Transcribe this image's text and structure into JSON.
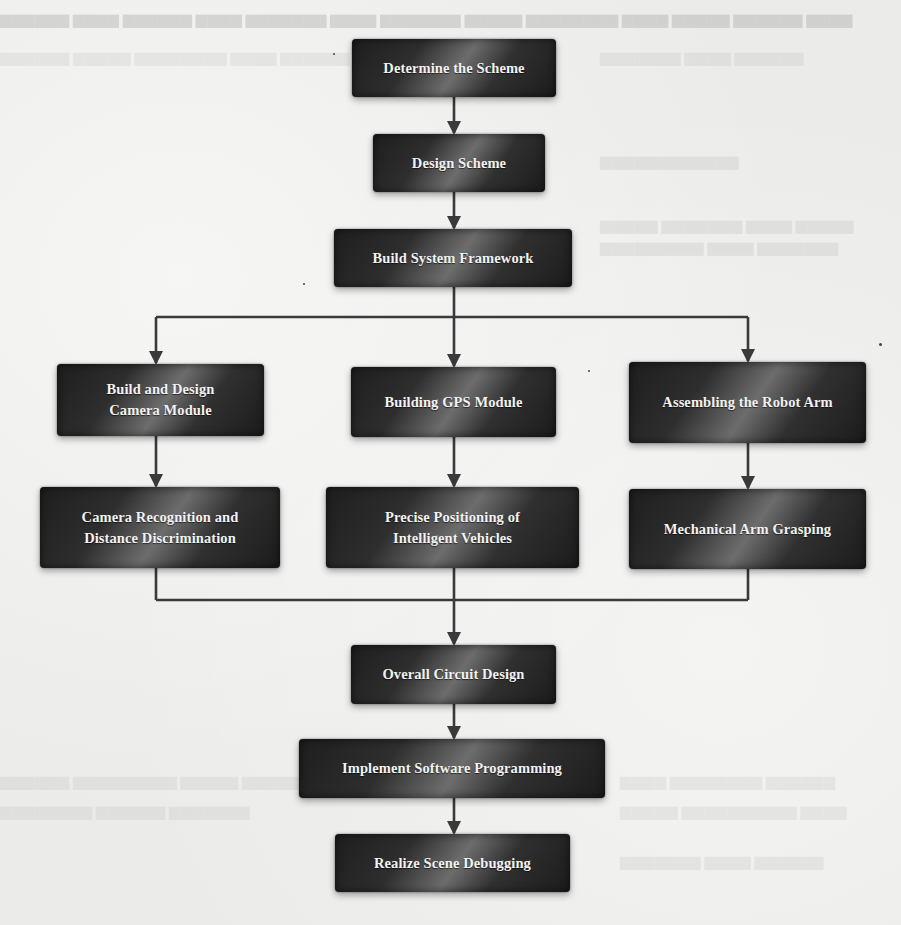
{
  "diagram": {
    "type": "flowchart",
    "colors": {
      "box_fill": "#2a2a2a",
      "box_text": "#f2f2f2",
      "connector": "#3a3a3a",
      "page_background": "#ebebe9"
    },
    "nodes": [
      {
        "id": "determine",
        "lines": [
          "Determine the Scheme"
        ]
      },
      {
        "id": "design",
        "lines": [
          "Design Scheme"
        ]
      },
      {
        "id": "framework",
        "lines": [
          "Build System Framework"
        ]
      },
      {
        "id": "camera_module",
        "lines": [
          "Build and Design",
          "Camera Module"
        ]
      },
      {
        "id": "gps_module",
        "lines": [
          "Building GPS Module"
        ]
      },
      {
        "id": "robot_arm",
        "lines": [
          "Assembling the Robot Arm"
        ]
      },
      {
        "id": "camera_recognition",
        "lines": [
          "Camera Recognition and",
          "Distance Discrimination"
        ]
      },
      {
        "id": "precise_positioning",
        "lines": [
          "Precise Positioning of",
          "Intelligent Vehicles"
        ]
      },
      {
        "id": "arm_grasping",
        "lines": [
          "Mechanical Arm Grasping"
        ]
      },
      {
        "id": "circuit_design",
        "lines": [
          "Overall Circuit Design"
        ]
      },
      {
        "id": "software",
        "lines": [
          "Implement Software Programming"
        ]
      },
      {
        "id": "debugging",
        "lines": [
          "Realize Scene Debugging"
        ]
      }
    ],
    "edges": [
      {
        "from": "determine",
        "to": "design"
      },
      {
        "from": "design",
        "to": "framework"
      },
      {
        "from": "framework",
        "to": "camera_module"
      },
      {
        "from": "framework",
        "to": "gps_module"
      },
      {
        "from": "framework",
        "to": "robot_arm"
      },
      {
        "from": "camera_module",
        "to": "camera_recognition"
      },
      {
        "from": "gps_module",
        "to": "precise_positioning"
      },
      {
        "from": "robot_arm",
        "to": "arm_grasping"
      },
      {
        "from": "camera_recognition",
        "to": "circuit_design"
      },
      {
        "from": "precise_positioning",
        "to": "circuit_design"
      },
      {
        "from": "arm_grasping",
        "to": "circuit_design"
      },
      {
        "from": "circuit_design",
        "to": "software"
      },
      {
        "from": "software",
        "to": "debugging"
      }
    ]
  }
}
